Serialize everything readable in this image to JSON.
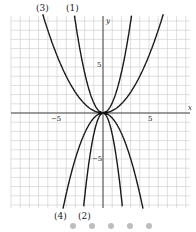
{
  "chart_data": {
    "type": "line",
    "title": "",
    "xlabel": "x",
    "ylabel": "y",
    "xlim": [
      -10,
      9.5
    ],
    "ylim": [
      -10.5,
      10.5
    ],
    "grid": true,
    "x_ticks": [
      {
        "value": -5,
        "label": "-5"
      },
      {
        "value": 5,
        "label": "5"
      }
    ],
    "y_ticks": [
      {
        "value": 5,
        "label": "5"
      },
      {
        "value": -5,
        "label": "-5"
      }
    ],
    "origin_label": "O",
    "series": [
      {
        "name": "(1)",
        "a": 1.1,
        "label_pos": "top"
      },
      {
        "name": "(2)",
        "a": -2.3,
        "label_pos": "bottom"
      },
      {
        "name": "(3)",
        "a": 0.25,
        "label_pos": "top"
      },
      {
        "name": "(4)",
        "a": -0.55,
        "label_pos": "bottom"
      }
    ],
    "points": [
      {
        "x": -0.3,
        "y": 0
      },
      {
        "x": 0.3,
        "y": 0
      }
    ]
  },
  "labels": {
    "c1": "(1)",
    "c2": "(2)",
    "c3": "(3)",
    "c4": "(4)",
    "x_axis": "x",
    "y_axis": "y",
    "tick_neg5": "−5",
    "tick_pos5": "5",
    "ytick_pos5": "5",
    "ytick_neg5": "−5"
  },
  "pager": {
    "count": 5
  }
}
